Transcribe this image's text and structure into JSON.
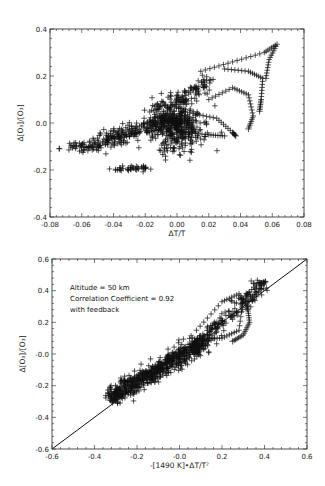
{
  "chart_data": [
    {
      "type": "scatter",
      "id": "top",
      "title": "",
      "xlabel": "ΔT/T",
      "ylabel": "Δ[O₃]/[O₃]",
      "xlim": [
        -0.08,
        0.08
      ],
      "ylim": [
        -0.4,
        0.4
      ],
      "xticks": [
        "-0.08",
        "-0.06",
        "-0.04",
        "-0.02",
        "0.00",
        "0.02",
        "0.04",
        "0.06",
        "0.08"
      ],
      "yticks": [
        "-0.4",
        "-0.2",
        "0.0",
        "0.2",
        "0.4"
      ],
      "marker": "+",
      "grid": false,
      "description": "Dense cluster near origin extending toward lower-left (-0.06,-0.11) and curling arcs to upper right reaching (0.063,0.33)",
      "clusters": [
        {
          "name": "core",
          "cx": 0.0,
          "cy": -0.02,
          "sx": 0.008,
          "sy": 0.05,
          "n": 380
        },
        {
          "name": "left-tail",
          "x0": -0.062,
          "y0": -0.11,
          "x1": 0.0,
          "y1": 0.02,
          "spread": 0.035,
          "n": 320
        },
        {
          "name": "lower-lobe",
          "x0": -0.038,
          "y0": -0.2,
          "x1": -0.02,
          "y1": -0.19,
          "spread": 0.01,
          "n": 40
        },
        {
          "name": "upper-band",
          "x0": -0.01,
          "y0": 0.05,
          "x1": 0.022,
          "y1": 0.19,
          "spread": 0.03,
          "n": 120
        }
      ],
      "arcs": [
        {
          "points": [
            [
              0.015,
              0.22
            ],
            [
              0.035,
              0.26
            ],
            [
              0.055,
              0.3
            ],
            [
              0.063,
              0.335
            ],
            [
              0.058,
              0.27
            ],
            [
              0.056,
              0.19
            ]
          ]
        },
        {
          "points": [
            [
              0.03,
              0.23
            ],
            [
              0.045,
              0.22
            ],
            [
              0.054,
              0.19
            ],
            [
              0.053,
              0.1
            ],
            [
              0.052,
              0.05
            ]
          ]
        },
        {
          "points": [
            [
              0.02,
              0.1
            ],
            [
              0.035,
              0.15
            ],
            [
              0.045,
              0.12
            ],
            [
              0.048,
              0.03
            ],
            [
              0.045,
              -0.025
            ]
          ]
        },
        {
          "points": [
            [
              0.01,
              0.04
            ],
            [
              0.025,
              0.02
            ],
            [
              0.035,
              -0.04
            ],
            [
              0.037,
              -0.055
            ]
          ]
        },
        {
          "points": [
            [
              0.005,
              -0.04
            ],
            [
              0.02,
              -0.05
            ],
            [
              0.03,
              -0.055
            ]
          ]
        }
      ]
    },
    {
      "type": "scatter",
      "id": "bottom",
      "title": "",
      "xlabel": "-[1490 K]•ΔT/T²",
      "ylabel": "Δ[O₃]/[O₃]",
      "xlim": [
        -0.6,
        0.6
      ],
      "ylim": [
        -0.6,
        0.6
      ],
      "xticks": [
        "-0.6",
        "-0.4",
        "-0.2",
        "-0.0",
        "0.2",
        "0.4",
        "0.6"
      ],
      "yticks": [
        "-0.6",
        "-0.4",
        "-0.2",
        "-0.0",
        "0.2",
        "0.4",
        "0.6"
      ],
      "marker": "+",
      "grid": false,
      "reference_line": {
        "from": [
          -0.6,
          -0.6
        ],
        "to": [
          0.6,
          0.6
        ],
        "label": "y = x"
      },
      "annotations": [
        "Altitude = 50 km",
        "Correlation Coefficient = 0.92",
        "with feedback"
      ],
      "correlation_coefficient": 0.92,
      "altitude_km": 50,
      "description": "Points scattered tightly along the 1:1 line from (-0.33,-0.32) to (0.4,0.5), with a loop near (0.25..0.33, 0.1..0.4)",
      "clusters": [
        {
          "name": "diagonal-band",
          "x0": -0.33,
          "y0": -0.28,
          "x1": 0.12,
          "y1": 0.08,
          "spread": 0.055,
          "n": 700
        },
        {
          "name": "upper-band",
          "x0": 0.1,
          "y0": 0.08,
          "x1": 0.4,
          "y1": 0.45,
          "spread": 0.05,
          "n": 160
        }
      ],
      "arcs": [
        {
          "points": [
            [
              0.08,
              0.15
            ],
            [
              0.2,
              0.33
            ],
            [
              0.28,
              0.38
            ],
            [
              0.32,
              0.3
            ],
            [
              0.33,
              0.2
            ],
            [
              0.3,
              0.12
            ],
            [
              0.25,
              0.08
            ]
          ]
        },
        {
          "points": [
            [
              0.12,
              0.1
            ],
            [
              0.2,
              0.1
            ],
            [
              0.28,
              0.15
            ],
            [
              0.3,
              0.35
            ],
            [
              0.37,
              0.45
            ],
            [
              0.4,
              0.45
            ]
          ]
        }
      ]
    }
  ]
}
